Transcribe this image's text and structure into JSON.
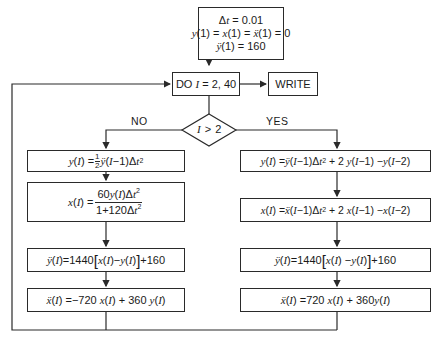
{
  "diagram": {
    "type": "flowchart",
    "init_box": {
      "line1": "Δt = 0.01",
      "line2": "y(1) = x(1) = ẍ(1) = 0",
      "line3": "ÿ(1) = 160"
    },
    "loop_box": {
      "label": "DO I = 2, 40"
    },
    "write_box": {
      "label": "WRITE"
    },
    "decision": {
      "label": "I > 2",
      "no_label": "NO",
      "yes_label": "YES"
    },
    "no_branch": [
      "y(I) = 1/2 ÿ(I−1)Δt²",
      "x(I) = 60y(I)Δt² / (1+120Δt²)",
      "ÿ(I) = 1440[x(I)−y(I)]+160",
      "ẍ(I) = −720 x(I) + 360 y(I)"
    ],
    "yes_branch": [
      "y(I) = ÿ(I−1)Δt² + 2y(I−1) − y(I−2)",
      "x(I) = ẍ(I−1)Δt² + 2x(I−1) − x(I−2)",
      "ÿ(I) = 1440[x(I) − y(I)] + 160",
      "ẍ(I) = 720 x(I) + 360 y(I)"
    ]
  },
  "text": {
    "dt_val": "0.01",
    "init_zero": "0",
    "init_yddot": "160",
    "do_prefix": "DO",
    "do_range": "= 2, 40",
    "write": "WRITE",
    "no": "NO",
    "yes": "YES",
    "gt2": "> 2",
    "n1440": "1440",
    "n160": "+160",
    "n60": "60",
    "n1p120": "1+120",
    "nm720": "−720",
    "n720": "720",
    "n360": "+ 360",
    "n2": "+ 2"
  }
}
